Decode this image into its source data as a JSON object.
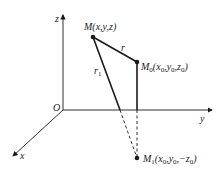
{
  "diagram": {
    "axes": {
      "z_label": "z",
      "y_label": "y",
      "x_label": "x",
      "origin_label": "O"
    },
    "points": {
      "M": {
        "name": "M",
        "coords": "(x,y,z)"
      },
      "M0": {
        "name": "M",
        "sub": "0",
        "coords_parts": [
          "(x",
          "0",
          ",y",
          "0",
          ",z",
          "0",
          ")"
        ]
      },
      "M1": {
        "name": "M",
        "sub": "1",
        "coords_parts": [
          "(x",
          "0",
          ",y",
          "0",
          ",−z",
          "0",
          ")"
        ]
      }
    },
    "segments": {
      "r_label": "r",
      "r1_label": "r",
      "r1_sub": "1"
    },
    "colors": {
      "stroke": "#1a1a1a",
      "background": "#ffffff"
    }
  }
}
